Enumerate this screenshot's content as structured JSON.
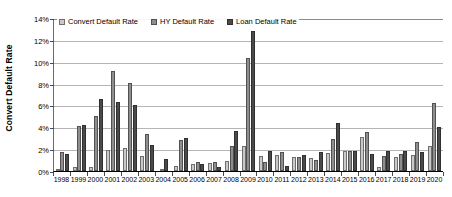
{
  "chart_data": {
    "type": "bar",
    "title": "",
    "xlabel": "",
    "ylabel": "Convert Default Rate",
    "ylim": [
      0,
      14
    ],
    "y_tick_labels": [
      "0%",
      "2%",
      "4%",
      "6%",
      "8%",
      "10%",
      "12%",
      "14%"
    ],
    "y_tick_values": [
      0,
      2,
      4,
      6,
      8,
      10,
      12,
      14
    ],
    "grid": true,
    "legend_position": "top-left-inside",
    "categories": [
      "1998",
      "1999",
      "2000",
      "2001",
      "2002",
      "2003",
      "2004",
      "2005",
      "2006",
      "2007",
      "2008",
      "2009",
      "2010",
      "2011",
      "2012",
      "2013",
      "2014",
      "2015",
      "2016",
      "2017",
      "2018",
      "2019",
      "2020"
    ],
    "series": [
      {
        "name": "Convert Default Rate",
        "color": "#c9c9c9",
        "values": [
          0.15,
          0.35,
          0.35,
          1.9,
          2.1,
          1.35,
          0.1,
          0.45,
          0.65,
          0.75,
          0.9,
          2.25,
          1.4,
          1.5,
          1.25,
          1.2,
          1.65,
          1.8,
          3.1,
          0.35,
          1.25,
          1.5,
          2.25
        ]
      },
      {
        "name": "HY Default Rate",
        "color": "#8e8e8e",
        "values": [
          1.7,
          4.15,
          5.0,
          9.15,
          8.05,
          3.35,
          0.0,
          2.8,
          0.85,
          0.8,
          2.3,
          10.3,
          0.85,
          1.7,
          1.3,
          1.0,
          2.95,
          1.8,
          3.6,
          1.35,
          1.6,
          2.7,
          6.25
        ]
      },
      {
        "name": "Loan Default Rate",
        "color": "#4a4a4a",
        "values": [
          1.55,
          4.2,
          6.6,
          6.3,
          6.0,
          2.4,
          1.1,
          3.0,
          0.6,
          0.35,
          3.7,
          12.8,
          1.85,
          0.5,
          1.5,
          1.75,
          4.35,
          1.8,
          1.6,
          1.85,
          1.8,
          1.75,
          4.0
        ]
      }
    ]
  }
}
